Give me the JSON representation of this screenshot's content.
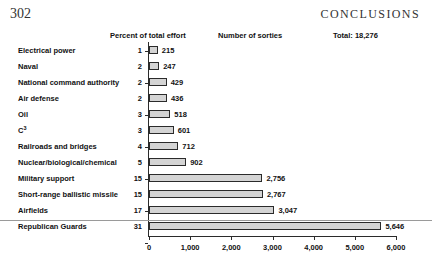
{
  "page": {
    "folio": "302",
    "running_head": "CONCLUSIONS"
  },
  "headers": {
    "percent": "Percent of total effort",
    "sorties": "Number of sorties",
    "total": "Total: 18,276"
  },
  "chart_data": {
    "type": "bar",
    "orientation": "horizontal",
    "title": "",
    "xlabel": "",
    "ylabel": "",
    "xlim": [
      0,
      6000
    ],
    "xticks": [
      0,
      1000,
      2000,
      3000,
      4000,
      5000,
      6000
    ],
    "xtick_labels": [
      "0",
      "1,000",
      "2,000",
      "3,000",
      "4,000",
      "5,000",
      "6,000"
    ],
    "grid": false,
    "legend": null,
    "bar_fill": "#d4d4d4",
    "bar_edge": "#2b2b2b",
    "total_sorties": 18276,
    "categories": [
      "Electrical power",
      "Naval",
      "National command authority",
      "Air defense",
      "Oil",
      "C3",
      "Railroads and bridges",
      "Nuclear/biological/chemical",
      "Military support",
      "Short-range ballistic missile",
      "Airfields",
      "Republican Guards"
    ],
    "values": [
      215,
      247,
      429,
      436,
      518,
      601,
      712,
      902,
      2756,
      2767,
      3047,
      5646
    ],
    "value_labels": [
      "215",
      "247",
      "429",
      "436",
      "518",
      "601",
      "712",
      "902",
      "2,756",
      "2,767",
      "3,047",
      "5,646"
    ],
    "percents": [
      1,
      2,
      2,
      2,
      3,
      3,
      4,
      5,
      15,
      15,
      17,
      31
    ],
    "percent_labels": [
      "1",
      "2",
      "2",
      "2",
      "3",
      "3",
      "4",
      "5",
      "15",
      "15",
      "17",
      "31"
    ],
    "rows": [
      {
        "label": "Electrical power",
        "label_html": "Electrical power",
        "percent": "1",
        "value": 215,
        "value_label": "215"
      },
      {
        "label": "Naval",
        "label_html": "Naval",
        "percent": "2",
        "value": 247,
        "value_label": "247"
      },
      {
        "label": "National command authority",
        "label_html": "National command authority",
        "percent": "2",
        "value": 429,
        "value_label": "429"
      },
      {
        "label": "Air defense",
        "label_html": "Air defense",
        "percent": "2",
        "value": 436,
        "value_label": "436"
      },
      {
        "label": "Oil",
        "label_html": "Oil",
        "percent": "3",
        "value": 518,
        "value_label": "518"
      },
      {
        "label": "C3",
        "label_html": "C<sup>3</sup>",
        "percent": "3",
        "value": 601,
        "value_label": "601"
      },
      {
        "label": "Railroads and bridges",
        "label_html": "Railroads and bridges",
        "percent": "4",
        "value": 712,
        "value_label": "712"
      },
      {
        "label": "Nuclear/biological/chemical",
        "label_html": "Nuclear/biological/chemical",
        "percent": "5",
        "value": 902,
        "value_label": "902"
      },
      {
        "label": "Military support",
        "label_html": "Military support",
        "percent": "15",
        "value": 2756,
        "value_label": "2,756"
      },
      {
        "label": "Short-range ballistic missile",
        "label_html": "Short-range ballistic missile",
        "percent": "15",
        "value": 2767,
        "value_label": "2,767"
      },
      {
        "label": "Airfields",
        "label_html": "Airfields",
        "percent": "17",
        "value": 3047,
        "value_label": "3,047"
      },
      {
        "label": "Republican Guards",
        "label_html": "Republican Guards",
        "percent": "31",
        "value": 5646,
        "value_label": "5,646"
      }
    ]
  }
}
